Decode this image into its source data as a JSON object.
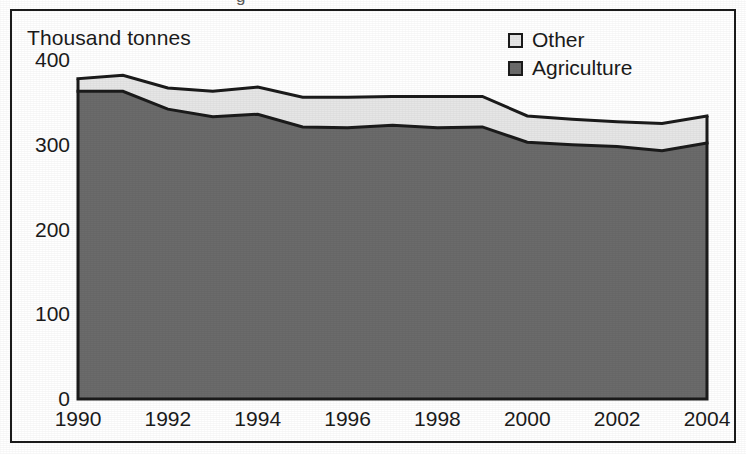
{
  "figure": {
    "cropped_title_fragment": "g",
    "background_color": "#ffffff",
    "border_color": "#1b1b1b"
  },
  "axis": {
    "units_label": "Thousand tonnes",
    "y_ticks": [
      "0",
      "100",
      "200",
      "300",
      "400"
    ],
    "x_ticks": [
      "1990",
      "1992",
      "1994",
      "1996",
      "1998",
      "2000",
      "2002",
      "2004"
    ]
  },
  "legend": {
    "items": [
      {
        "label": "Other",
        "color": "#e6e6e6"
      },
      {
        "label": "Agriculture",
        "color": "#6b6b6b"
      }
    ]
  },
  "chart_data": {
    "type": "area",
    "stacked": true,
    "title": "",
    "subtitle": "",
    "xlabel": "",
    "ylabel": "Thousand tonnes",
    "ylim": [
      0,
      400
    ],
    "xlim": [
      1990,
      2004
    ],
    "grid": false,
    "legend_position": "top-right",
    "x": [
      1990,
      1991,
      1992,
      1993,
      1994,
      1995,
      1996,
      1997,
      1998,
      1999,
      2000,
      2001,
      2002,
      2003,
      2004
    ],
    "categories": [
      "1990",
      "1991",
      "1992",
      "1993",
      "1994",
      "1995",
      "1996",
      "1997",
      "1998",
      "1999",
      "2000",
      "2001",
      "2002",
      "2003",
      "2004"
    ],
    "series": [
      {
        "name": "Agriculture",
        "color": "#6b6b6b",
        "values": [
          363,
          363,
          342,
          333,
          336,
          321,
          320,
          323,
          320,
          321,
          303,
          300,
          298,
          293,
          302
        ]
      },
      {
        "name": "Other",
        "color": "#e6e6e6",
        "values": [
          15,
          19,
          25,
          30,
          32,
          35,
          36,
          34,
          37,
          36,
          31,
          30,
          29,
          32,
          32
        ]
      }
    ],
    "totals": [
      378,
      382,
      367,
      363,
      368,
      356,
      356,
      357,
      357,
      357,
      334,
      330,
      327,
      325,
      334
    ]
  }
}
